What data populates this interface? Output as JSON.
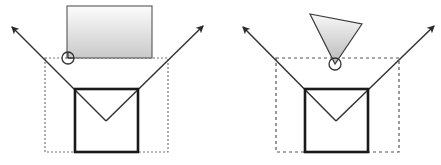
{
  "figure": {
    "background_color": "#ffffff",
    "width": 441,
    "height": 165,
    "panels": [
      {
        "id": "left-panel",
        "name": "rectangular-source-diagram",
        "source_shape": {
          "type": "rectangle",
          "name": "gradient-rectangle",
          "x": 67,
          "y": 6,
          "width": 85,
          "height": 52,
          "stroke_color": "#555555",
          "fill_gradient_top": "#fcfcfc",
          "fill_gradient_bottom": "#c9c9c9"
        },
        "pivot_marker": {
          "type": "circle",
          "name": "pivot-circle",
          "cx": 68,
          "cy": 58,
          "r": 6,
          "stroke_color": "#333333",
          "fill_color": "none"
        },
        "bounding_box": {
          "name": "dotted-bounding-box",
          "x": 45,
          "y": 58,
          "width": 123,
          "height": 94,
          "stroke_color": "#777777",
          "dash": "2,2"
        },
        "solid_box": {
          "name": "solid-square",
          "x": 75,
          "y": 89,
          "width": 63,
          "height": 63,
          "stroke_color": "#1a1a1a",
          "stroke_width": 2.6
        },
        "rays": [
          {
            "name": "ray-left",
            "x1": 106,
            "y1": 121,
            "x2": 10,
            "y2": 25,
            "arrow": true,
            "stroke_color": "#333333"
          },
          {
            "name": "ray-right",
            "x1": 106,
            "y1": 121,
            "x2": 205,
            "y2": 24,
            "arrow": true,
            "stroke_color": "#333333"
          }
        ]
      },
      {
        "id": "right-panel",
        "name": "conical-source-diagram",
        "source_shape": {
          "type": "triangle",
          "name": "gradient-cone",
          "apex_x": 335,
          "apex_y": 64,
          "left_x": 310,
          "left_y": 14,
          "right_x": 362,
          "right_y": 24,
          "stroke_color": "#555555",
          "fill_gradient_top": "#f8f8f8",
          "fill_gradient_bottom": "#b8b8b8"
        },
        "pivot_marker": {
          "type": "circle",
          "name": "pivot-circle",
          "cx": 335,
          "cy": 64,
          "r": 6,
          "stroke_color": "#333333",
          "fill_color": "none"
        },
        "bounding_box": {
          "name": "dotted-bounding-box",
          "x": 276,
          "y": 58,
          "width": 123,
          "height": 94,
          "stroke_color": "#555555",
          "dash": "3,3"
        },
        "solid_box": {
          "name": "solid-square",
          "x": 305,
          "y": 89,
          "width": 63,
          "height": 63,
          "stroke_color": "#1a1a1a",
          "stroke_width": 2.6
        },
        "rays": [
          {
            "name": "ray-left",
            "x1": 336,
            "y1": 121,
            "x2": 241,
            "y2": 25,
            "arrow": true,
            "stroke_color": "#333333"
          },
          {
            "name": "ray-right",
            "x1": 336,
            "y1": 121,
            "x2": 436,
            "y2": 24,
            "arrow": true,
            "stroke_color": "#333333"
          }
        ]
      }
    ]
  }
}
